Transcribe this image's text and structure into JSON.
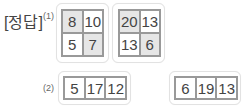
{
  "answer_label": "[정답]",
  "part1": {
    "marker": "(1)",
    "grids": [
      {
        "cells": [
          {
            "value": "8",
            "shaded": true
          },
          {
            "value": "10",
            "shaded": false
          },
          {
            "value": "5",
            "shaded": false
          },
          {
            "value": "7",
            "shaded": true
          }
        ]
      },
      {
        "cells": [
          {
            "value": "20",
            "shaded": true
          },
          {
            "value": "13",
            "shaded": false
          },
          {
            "value": "13",
            "shaded": false
          },
          {
            "value": "6",
            "shaded": true
          }
        ]
      }
    ]
  },
  "part2": {
    "marker": "(2)",
    "rows": [
      {
        "cells": [
          {
            "value": "5"
          },
          {
            "value": "17"
          },
          {
            "value": "12"
          }
        ]
      },
      {
        "cells": [
          {
            "value": "6"
          },
          {
            "value": "19"
          },
          {
            "value": "13"
          }
        ]
      }
    ]
  }
}
